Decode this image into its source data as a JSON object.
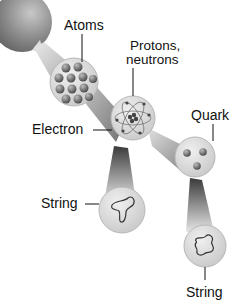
{
  "diagram": {
    "labels": {
      "atoms": "Atoms",
      "protons_line1": "Protons,",
      "protons_line2": "neutrons",
      "electron": "Electron",
      "quark": "Quark",
      "string_left": "String",
      "string_bottom": "String"
    },
    "nodes": [
      {
        "id": "matter",
        "description": "large gray sphere (matter)"
      },
      {
        "id": "atoms",
        "description": "circle containing a lattice of atoms"
      },
      {
        "id": "nucleus",
        "description": "atom with electron orbits and nucleus of protons, neutrons"
      },
      {
        "id": "quark",
        "description": "circle with three quarks"
      },
      {
        "id": "string-1",
        "description": "circle with vibrating open string loop"
      },
      {
        "id": "string-2",
        "description": "circle with vibrating closed string loop"
      }
    ],
    "colors": {
      "sphere": "#8a8a8a",
      "circle_fill": "#d9d9d9",
      "beam": "#9a9a9a",
      "text": "#111111"
    }
  }
}
